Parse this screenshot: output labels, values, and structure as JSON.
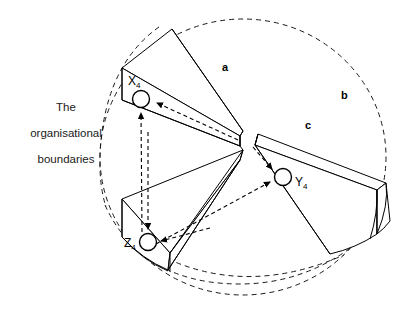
{
  "figure": {
    "background_color": "#ffffff",
    "line_color": "#000000",
    "dashed_color": "#1a1a1a",
    "width": 411,
    "height": 314
  },
  "caption": {
    "text": "The\norganisational\nboundaries",
    "line_1": "The",
    "line_2": "organisational",
    "line_3": "boundaries"
  },
  "sector_labels": [
    {
      "id": "a",
      "label": "a",
      "x": 222,
      "y": 71
    },
    {
      "id": "b",
      "label": "b",
      "x": 341,
      "y": 99
    },
    {
      "id": "c",
      "label": "c",
      "x": 305,
      "y": 129
    }
  ],
  "nodes": [
    {
      "id": "x4",
      "label": "X",
      "subscript": "4",
      "label_x": 128,
      "label_y": 80,
      "circle_x": 141,
      "circle_y": 99,
      "radius": 8.5,
      "sector": "a"
    },
    {
      "id": "y4",
      "label": "Y",
      "subscript": "4",
      "label_x": 294,
      "label_y": 185,
      "circle_x": 283,
      "circle_y": 177,
      "radius": 8.5,
      "sector": "c"
    },
    {
      "id": "z4",
      "label": "Z",
      "subscript": "4",
      "label_x": 126,
      "label_y": 246,
      "circle_x": 148,
      "circle_y": 242,
      "radius": 8.5,
      "sector": "bottom-left"
    }
  ],
  "boundary": {
    "name": "organisational-boundary-ellipse",
    "style": "dashed",
    "center_x": 243,
    "center_y": 157,
    "radius_x": 143,
    "radius_y": 138
  },
  "connections": [
    {
      "from": "z4",
      "to": "x4",
      "style": "dashed",
      "arrow": "single"
    },
    {
      "from": "center",
      "to": "x4",
      "style": "dashed",
      "arrow": "single"
    },
    {
      "from": "center",
      "to": "y4",
      "style": "dashed",
      "arrow": "single"
    },
    {
      "from": "z4",
      "to": "y4",
      "style": "dashed",
      "arrow": "single"
    },
    {
      "from": "center",
      "to": "z4",
      "style": "dashed",
      "arrow": "single"
    }
  ],
  "wedges": [
    {
      "id": "wedge-a-upper-left",
      "sector": "a",
      "has_node": "x4"
    },
    {
      "id": "wedge-c-right",
      "sector": "c",
      "has_node": "y4"
    },
    {
      "id": "wedge-bottom-left",
      "sector": "bottom-left",
      "has_node": "z4"
    }
  ]
}
